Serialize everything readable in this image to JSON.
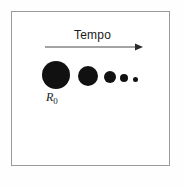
{
  "figure": {
    "background_color": "#ffffff",
    "frame_color": "#9a9a9a",
    "axis_label": "Tempo",
    "axis_arrow_direction": "right",
    "radius_label_main": "R",
    "radius_label_sub": "0",
    "mark_color": "#111111",
    "text_color": "#1a1a1a"
  },
  "chart_data": {
    "type": "scatter",
    "title": "",
    "subtitle": "",
    "xlabel": "Tempo",
    "ylabel": "",
    "grid": false,
    "legend": "none",
    "annotations": [
      {
        "text": "R0",
        "target_index": 0,
        "position": "below-left"
      }
    ],
    "series": [
      {
        "name": "Raio da gota",
        "marker": "filled-circle",
        "color": "#111111",
        "points": [
          {
            "x": 0,
            "y": 0,
            "diameter_px": 28,
            "cx_px": 56,
            "cy_px": 75
          },
          {
            "x": 1,
            "y": 0,
            "diameter_px": 20,
            "cx_px": 88,
            "cy_px": 76
          },
          {
            "x": 2,
            "y": 0,
            "diameter_px": 12,
            "cx_px": 110,
            "cy_px": 77
          },
          {
            "x": 3,
            "y": 0,
            "diameter_px": 8,
            "cx_px": 124,
            "cy_px": 78
          },
          {
            "x": 4,
            "y": 0,
            "diameter_px": 5,
            "cx_px": 135,
            "cy_px": 79
          }
        ]
      }
    ],
    "xlim": [
      0,
      4
    ],
    "ylim": [
      0,
      1
    ]
  }
}
